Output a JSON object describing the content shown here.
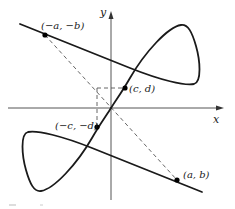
{
  "diagram": {
    "type": "parametric-curve-with-point-symmetry",
    "colors": {
      "curve": "#1a1a1a",
      "axes": "#555555",
      "dashed": "#555555",
      "points": "#000000",
      "background": "#ffffff"
    },
    "axes": {
      "x_label": "x",
      "y_label": "y",
      "origin_px": [
        111,
        108
      ]
    },
    "points": [
      {
        "id": "neg-a-neg-b",
        "label": "(−a, −b)",
        "px": [
          45,
          35
        ]
      },
      {
        "id": "c-d",
        "label": "(c, d)",
        "px": [
          125,
          88
        ]
      },
      {
        "id": "neg-c-neg-d",
        "label": "(−c, −d)",
        "px": [
          97,
          127
        ]
      },
      {
        "id": "a-b",
        "label": "(a, b)",
        "px": [
          177,
          180
        ]
      }
    ],
    "caption": ""
  }
}
